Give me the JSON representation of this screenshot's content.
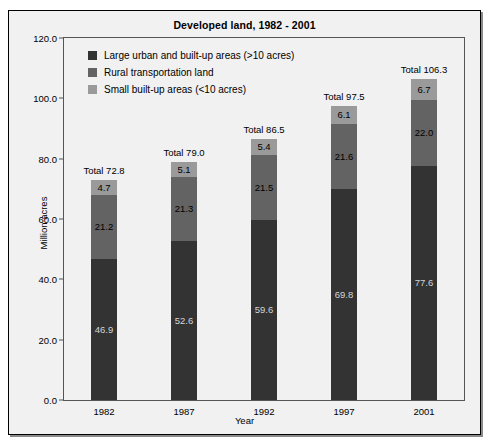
{
  "chart_data": {
    "type": "bar",
    "subtype": "stacked-bar",
    "title": "Developed land, 1982 - 2001",
    "xlabel": "Year",
    "ylabel": "Million acres",
    "categories": [
      "1982",
      "1987",
      "1992",
      "1997",
      "2001"
    ],
    "ylim": [
      0,
      120
    ],
    "yticks": [
      "0.0",
      "20.0",
      "40.0",
      "60.0",
      "80.0",
      "100.0",
      "120.0"
    ],
    "ytick_values": [
      0,
      20,
      40,
      60,
      80,
      100,
      120
    ],
    "grid": false,
    "legend_position": "upper-left-inside",
    "series": [
      {
        "name": "Large urban and built-up areas (>10 acres)",
        "color": "#333333",
        "values": [
          46.9,
          52.6,
          59.6,
          69.8,
          77.6
        ],
        "labels": [
          "46.9",
          "52.6",
          "59.6",
          "69.8",
          "77.6"
        ]
      },
      {
        "name": "Rural transportation land",
        "color": "#636363",
        "values": [
          21.2,
          21.3,
          21.5,
          21.6,
          22.0
        ],
        "labels": [
          "21.2",
          "21.3",
          "21.5",
          "21.6",
          "22.0"
        ]
      },
      {
        "name": "Small built-up areas (<10 acres)",
        "color": "#9a9a9a",
        "values": [
          4.7,
          5.1,
          5.4,
          6.1,
          6.7
        ],
        "labels": [
          "4.7",
          "5.1",
          "5.4",
          "6.1",
          "6.7"
        ]
      }
    ],
    "totals": [
      72.8,
      79.0,
      86.5,
      97.5,
      106.3
    ],
    "total_labels": [
      "Total 72.8",
      "Total 79.0",
      "Total 86.5",
      "Total 97.5",
      "Total 106.3"
    ]
  }
}
